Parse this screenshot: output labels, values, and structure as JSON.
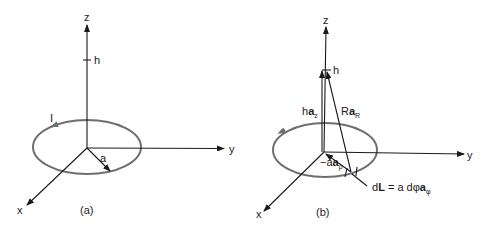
{
  "figure": {
    "panel_a": {
      "caption": "(a)",
      "axes": {
        "x": "x",
        "y": "y",
        "z": "z"
      },
      "height_label": "h",
      "current_label": "I",
      "radius_label": "a"
    },
    "panel_b": {
      "caption": "(b)",
      "axes": {
        "x": "x",
        "y": "y",
        "z": "z"
      },
      "height_label": "h",
      "vector_h": {
        "scalar": "h",
        "unit": "a",
        "subscript": "z"
      },
      "vector_R": {
        "scalar": "R",
        "unit": "a",
        "subscript": "R"
      },
      "vector_rho": {
        "scalar": "−a",
        "unit": "a",
        "subscript": "ρ"
      },
      "dL": {
        "lhs": "d",
        "lhs_bold": "L",
        "eq": " = a dφ",
        "unit": "a",
        "subscript": "φ"
      }
    },
    "colors": {
      "loop": "#6e6e6e",
      "axis": "#1a1a1a"
    }
  }
}
